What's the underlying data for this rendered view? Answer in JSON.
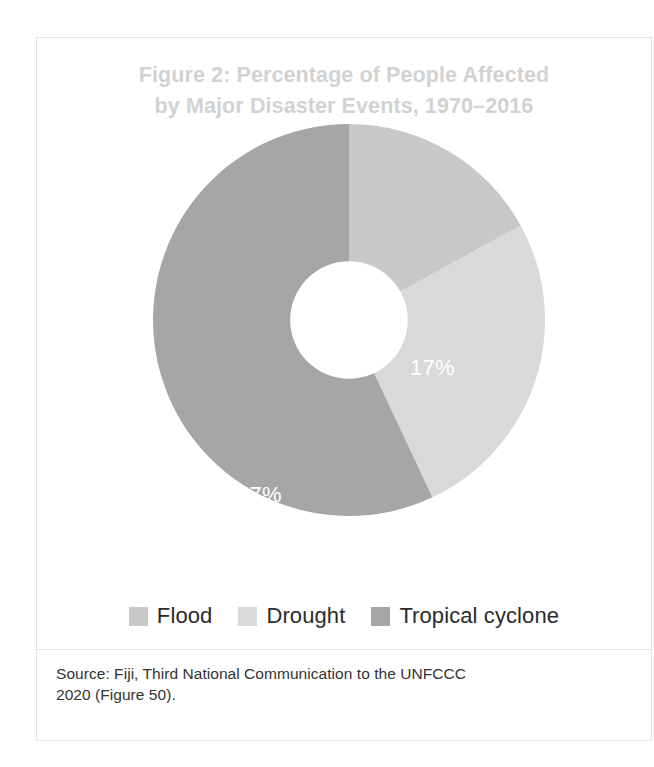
{
  "figure": {
    "title_line1": "Figure 2: Percentage of People Affected",
    "title_line2": "by Major Disaster Events, 1970–2016",
    "title_color": "#d2d2d2",
    "border_color": "#e3e3e3",
    "background": "#ffffff"
  },
  "chart_data": {
    "type": "pie",
    "variant": "donut",
    "title": "Figure 2: Percentage of People Affected by Major Disaster Events, 1970–2016",
    "unit": "%",
    "inner_radius_ratio": 0.3,
    "start_angle_deg": 0,
    "direction": "clockwise",
    "legend_position": "bottom",
    "grid": false,
    "categories": [
      "Flood",
      "Drought",
      "Tropical cyclone"
    ],
    "values": [
      57,
      17,
      26
    ],
    "data_labels": [
      "57%",
      "17%",
      "26%"
    ],
    "colors": [
      "#c8c8c8",
      "#d9d9d9",
      "#a6a6a6"
    ],
    "label_color": "#ffffff",
    "slices": [
      {
        "label": "Drought",
        "value": 17,
        "display": "17%",
        "color": "#c8c8c8",
        "order": 1
      },
      {
        "label": "Tropical cyclone",
        "value": 26,
        "display": "26%",
        "color": "#d9d9d9",
        "order": 2
      },
      {
        "label": "Flood",
        "value": 57,
        "display": "57%",
        "color": "#a6a6a6",
        "order": 3
      }
    ]
  },
  "legend": {
    "items": [
      {
        "label": "Flood",
        "color": "#c8c8c8"
      },
      {
        "label": "Drought",
        "color": "#d9d9d9"
      },
      {
        "label": "Tropical cyclone",
        "color": "#a6a6a6"
      }
    ]
  },
  "source": {
    "line1": "Source: Fiji, Third National Communication to the UNFCCC",
    "line2": "2020 (Figure 50)."
  }
}
